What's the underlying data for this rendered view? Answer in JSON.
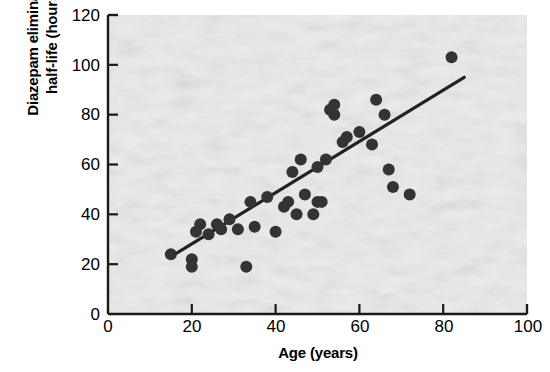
{
  "chart_data": {
    "type": "scatter",
    "title": "",
    "xlabel": "Age (years)",
    "ylabel": "Diazepam elimination half-life (hours)",
    "xlim": [
      0,
      100
    ],
    "ylim": [
      0,
      120
    ],
    "xticks": [
      0,
      20,
      40,
      60,
      80,
      100
    ],
    "yticks": [
      0,
      20,
      40,
      60,
      80,
      100,
      120
    ],
    "grid": false,
    "legend": null,
    "series": [
      {
        "name": "Patients",
        "marker": "filled-circle",
        "color": "#333333",
        "points": [
          [
            15,
            24
          ],
          [
            20,
            22
          ],
          [
            20,
            19
          ],
          [
            21,
            33
          ],
          [
            22,
            36
          ],
          [
            24,
            32
          ],
          [
            26,
            36
          ],
          [
            27,
            34
          ],
          [
            29,
            38
          ],
          [
            31,
            34
          ],
          [
            33,
            19
          ],
          [
            34,
            45
          ],
          [
            35,
            35
          ],
          [
            38,
            47
          ],
          [
            40,
            33
          ],
          [
            42,
            43
          ],
          [
            43,
            45
          ],
          [
            44,
            57
          ],
          [
            45,
            40
          ],
          [
            46,
            62
          ],
          [
            47,
            48
          ],
          [
            49,
            40
          ],
          [
            50,
            45
          ],
          [
            50,
            59
          ],
          [
            51,
            45
          ],
          [
            52,
            62
          ],
          [
            53,
            82
          ],
          [
            54,
            80
          ],
          [
            54,
            84
          ],
          [
            56,
            69
          ],
          [
            57,
            71
          ],
          [
            60,
            73
          ],
          [
            63,
            68
          ],
          [
            64,
            86
          ],
          [
            66,
            80
          ],
          [
            67,
            58
          ],
          [
            68,
            51
          ],
          [
            72,
            48
          ],
          [
            82,
            103
          ]
        ]
      }
    ],
    "trendline": {
      "name": "regression line",
      "color": "#222222",
      "x_start": 16,
      "y_start": 24,
      "x_end": 85,
      "y_end": 95
    }
  },
  "axes": {
    "y_axis_label": "Diazepam elimination half-life (hours)",
    "y_axis_label_line1": "Diazepam elimination",
    "y_axis_label_line2": "half-life (hours)",
    "x_axis_label": "Age (years)",
    "y_tick_labels": [
      "120",
      "100",
      "80",
      "60",
      "40",
      "20",
      "0"
    ],
    "x_tick_labels": [
      "0",
      "20",
      "40",
      "60",
      "80",
      "100"
    ]
  },
  "style": {
    "axis_color": "#1a1a1a",
    "marker_color": "#333333",
    "plot_background": "#eeeeee",
    "page_background": "#ffffff"
  }
}
